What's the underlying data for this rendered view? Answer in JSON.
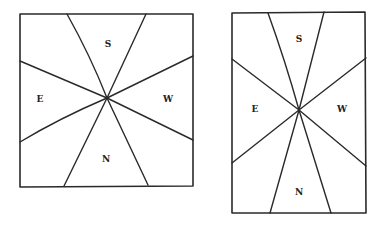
{
  "diagrams": [
    {
      "id": "square",
      "labels": {
        "top": "S",
        "left": "E",
        "right": "W",
        "bottom": "N"
      }
    },
    {
      "id": "rectangle",
      "labels": {
        "top": "S",
        "left": "E",
        "right": "W",
        "bottom": "N"
      }
    }
  ],
  "colors": {
    "line": "#2a2a2a",
    "background": "#ffffff"
  }
}
